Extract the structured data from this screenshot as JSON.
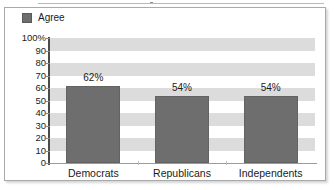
{
  "legend": {
    "series_label": "Agree",
    "swatch_color": "#6e6e6e"
  },
  "axis": {
    "y_tick_labels": [
      "100%",
      "90",
      "80",
      "70",
      "60",
      "50",
      "40",
      "30",
      "20",
      "10",
      "0"
    ],
    "y_min": 0,
    "y_max": 100
  },
  "bars": [
    {
      "category": "Democrats",
      "value": 62,
      "label": "62%"
    },
    {
      "category": "Republicans",
      "value": 54,
      "label": "54%"
    },
    {
      "category": "Independents",
      "value": 54,
      "label": "54%"
    }
  ],
  "chart_data": {
    "type": "bar",
    "title": "",
    "subtitle": "",
    "xlabel": "",
    "ylabel": "",
    "categories": [
      "Democrats",
      "Republicans",
      "Independents"
    ],
    "values": [
      62,
      54,
      54
    ],
    "data_labels": [
      "62%",
      "54%",
      "54%"
    ],
    "series": [
      {
        "name": "Agree",
        "values": [
          62,
          54,
          54
        ],
        "color": "#6e6e6e"
      }
    ],
    "ylim": [
      0,
      100
    ],
    "y_ticks": [
      0,
      10,
      20,
      30,
      40,
      50,
      60,
      70,
      80,
      90,
      100
    ],
    "y_tick_labels": [
      "0",
      "10",
      "20",
      "30",
      "40",
      "50",
      "60",
      "70",
      "80",
      "90",
      "100%"
    ],
    "y_unit": "percent",
    "grid": "horizontal-banded",
    "band_colors": [
      "#dcdcdc",
      "#ffffff"
    ],
    "band_interval": 10,
    "legend": {
      "entries": [
        "Agree"
      ],
      "position": "top-left"
    },
    "annotations": []
  }
}
